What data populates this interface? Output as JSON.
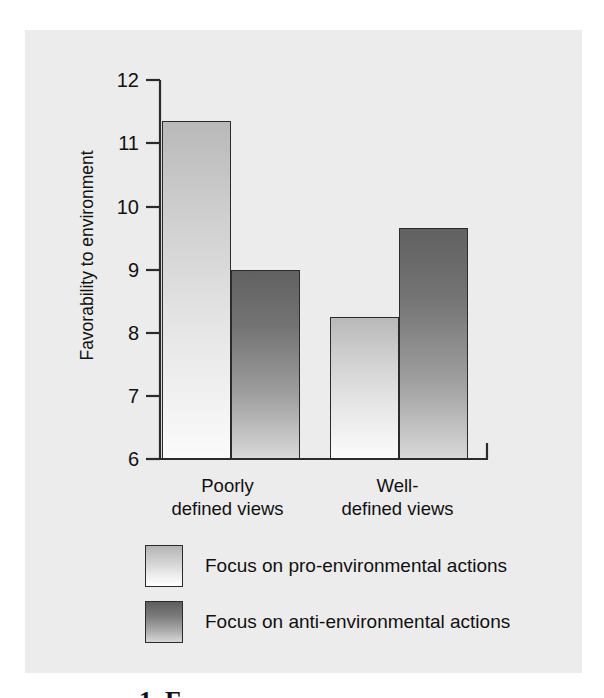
{
  "figure": {
    "background_color": "#ececec",
    "page_background": "#ffffff",
    "caption_fragment": "1. F"
  },
  "chart_data": {
    "type": "bar",
    "title": "",
    "xlabel": "",
    "ylabel": "Favorability to environment",
    "categories": [
      "Poorly defined views",
      "Well-defined views"
    ],
    "category_label_lines": [
      [
        "Poorly",
        "defined views"
      ],
      [
        "Well-",
        "defined views"
      ]
    ],
    "series": [
      {
        "name": "Focus on pro-environmental actions",
        "color": "#cfcfcf",
        "values": [
          11.35,
          8.25
        ]
      },
      {
        "name": "Focus on anti-environmental actions",
        "color": "#747474",
        "values": [
          9.0,
          9.65
        ]
      }
    ],
    "ylim": [
      6,
      12
    ],
    "yticks": [
      12,
      11,
      10,
      9,
      8,
      7,
      6
    ],
    "ytick_labels": [
      "12",
      "11",
      "10",
      "9",
      "8",
      "7",
      "6"
    ],
    "grid": false,
    "legend_position": "below-axes"
  },
  "legend": {
    "items": [
      {
        "label": "Focus on pro-environmental actions",
        "swatch": "light-gradient-swatch"
      },
      {
        "label": "Focus on anti-environmental actions",
        "swatch": "dark-gradient-swatch"
      }
    ]
  }
}
